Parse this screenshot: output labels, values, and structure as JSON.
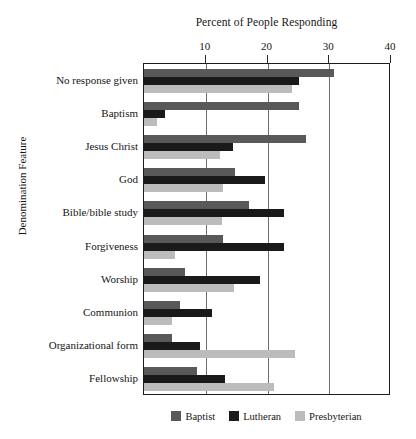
{
  "chart_data": {
    "type": "bar",
    "orientation": "horizontal",
    "title": "Percent of People Responding",
    "xlabel": "Percent of People Responding",
    "ylabel": "Denomination Feature",
    "xlim": [
      0,
      40
    ],
    "xticks": [
      10,
      20,
      30,
      40
    ],
    "grid": "vertical",
    "legend_position": "bottom",
    "categories": [
      "No response given",
      "Baptism",
      "Jesus Christ",
      "God",
      "Bible/bible study",
      "Forgiveness",
      "Worship",
      "Communion",
      "Organizational form",
      "Fellowship"
    ],
    "series": [
      {
        "name": "Baptist",
        "color": "#595959",
        "values": [
          30.8,
          25.1,
          26.2,
          14.7,
          17.0,
          12.8,
          6.6,
          5.8,
          4.6,
          8.6
        ]
      },
      {
        "name": "Lutheran",
        "color": "#1a1a1a",
        "values": [
          25.1,
          3.4,
          14.4,
          19.6,
          22.7,
          22.7,
          18.8,
          11.0,
          9.1,
          13.1
        ]
      },
      {
        "name": "Presbyterian",
        "color": "#bcbcbc",
        "values": [
          24.0,
          2.1,
          12.3,
          12.8,
          12.7,
          5.0,
          14.6,
          4.6,
          24.5,
          21.1
        ]
      }
    ]
  }
}
